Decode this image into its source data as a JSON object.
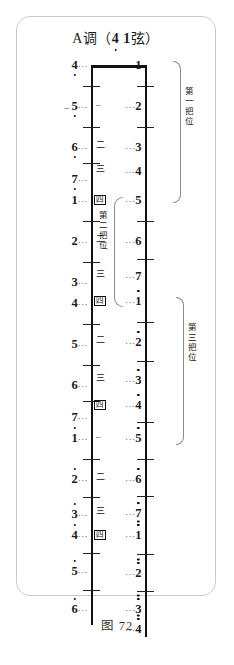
{
  "figure": {
    "title_prefix": "A调（",
    "title_note_low": "4",
    "title_note_high": "1",
    "title_suffix": "弦）",
    "caption": "图 72"
  },
  "strings": {
    "left_name": "4",
    "right_name": "1"
  },
  "left_notes": [
    {
      "num": "4",
      "octave": "down",
      "tick": "",
      "y": 4
    },
    {
      "num": "5",
      "octave": "down",
      "tick": "–",
      "y": 45
    },
    {
      "num": "6",
      "octave": "down",
      "tick": "",
      "y": 86
    },
    {
      "num": "7",
      "octave": "down",
      "tick": "",
      "y": 118
    },
    {
      "num": "1",
      "octave": "none",
      "tick": "",
      "y": 139
    },
    {
      "num": "2",
      "octave": "none",
      "tick": "",
      "y": 180
    },
    {
      "num": "3",
      "octave": "none",
      "tick": "",
      "y": 221
    },
    {
      "num": "4",
      "octave": "none",
      "tick": "",
      "y": 242
    },
    {
      "num": "5",
      "octave": "none",
      "tick": "",
      "y": 283
    },
    {
      "num": "6",
      "octave": "none",
      "tick": "",
      "y": 324
    },
    {
      "num": "7",
      "octave": "none",
      "tick": "",
      "y": 356
    },
    {
      "num": "1",
      "octave": "up1",
      "tick": "",
      "y": 377
    },
    {
      "num": "2",
      "octave": "up1",
      "tick": "",
      "y": 418
    },
    {
      "num": "3",
      "octave": "up1",
      "tick": "",
      "y": 453
    },
    {
      "num": "4",
      "octave": "up1",
      "tick": "",
      "y": 474
    },
    {
      "num": "5",
      "octave": "up1",
      "tick": "",
      "y": 510
    },
    {
      "num": "6",
      "octave": "up1",
      "tick": "",
      "y": 548
    }
  ],
  "right_notes": [
    {
      "num": "1",
      "octave": "none",
      "tick": "",
      "y": 4
    },
    {
      "num": "2",
      "octave": "none",
      "tick": "–",
      "y": 45
    },
    {
      "num": "3",
      "octave": "none",
      "tick": "二",
      "y": 86
    },
    {
      "num": "4",
      "octave": "none",
      "tick": "三",
      "y": 110
    },
    {
      "num": "5",
      "octave": "none",
      "tick": "四",
      "y": 139
    },
    {
      "num": "6",
      "octave": "none",
      "tick": "二",
      "y": 180
    },
    {
      "num": "7",
      "octave": "none",
      "tick": "三",
      "y": 215
    },
    {
      "num": "1",
      "octave": "up1",
      "tick": "四",
      "y": 240
    },
    {
      "num": "2",
      "octave": "up1",
      "tick": "二",
      "y": 281
    },
    {
      "num": "3",
      "octave": "up1",
      "tick": "三",
      "y": 319
    },
    {
      "num": "4",
      "octave": "up1",
      "tick": "四",
      "y": 344
    },
    {
      "num": "5",
      "octave": "up1",
      "tick": "–",
      "y": 377
    },
    {
      "num": "6",
      "octave": "up1",
      "tick": "二",
      "y": 418
    },
    {
      "num": "7",
      "octave": "up1",
      "tick": "三",
      "y": 452
    },
    {
      "num": "1",
      "octave": "up2",
      "tick": "四",
      "y": 474
    },
    {
      "num": "2",
      "octave": "up2",
      "tick": "",
      "y": 512
    },
    {
      "num": "3",
      "octave": "up2",
      "tick": "",
      "y": 548
    },
    {
      "num": "4",
      "octave": "up2",
      "tick": "",
      "y": 568
    }
  ],
  "positions": [
    {
      "label": "第一把位",
      "side": "right"
    },
    {
      "label": "第二把位",
      "side": "inner"
    },
    {
      "label": "第三把位",
      "side": "right"
    }
  ],
  "finger_marks": [
    "一",
    "二",
    "三",
    "四"
  ]
}
